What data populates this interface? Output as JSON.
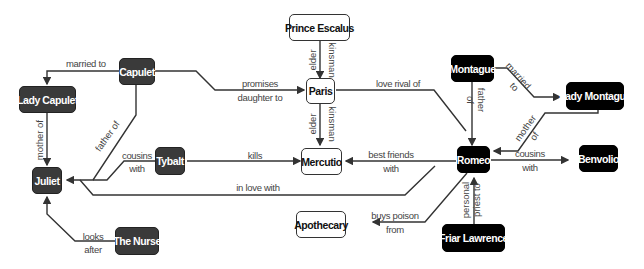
{
  "diagram": {
    "colors": {
      "capulet": "#3a3a3a",
      "montague": "#000000",
      "neutral": "#ffffff",
      "edge": "#333333"
    },
    "nodes": {
      "capulet": "Capulet",
      "lady_capulet": "Lady Capulet",
      "juliet": "Juliet",
      "tybalt": "Tybalt",
      "the_nurse": "The Nurse",
      "prince_escalus": "Prince Escalus",
      "paris": "Paris",
      "mercutio": "Mercutio",
      "apothecary": "Apothecary",
      "montague": "Montague",
      "lady_montague": "Lady Montague",
      "romeo": "Romeo",
      "benvolio": "Benvolio",
      "friar_lawrence": "Friar Lawrence"
    },
    "edges": {
      "capulet_lady": [
        "married to"
      ],
      "lady_juliet": [
        "mother of"
      ],
      "capulet_juliet": [
        "father of"
      ],
      "capulet_paris": [
        "promises",
        "daughter to"
      ],
      "tybalt_juliet": [
        "cousins",
        "with"
      ],
      "nurse_juliet": [
        "looks",
        "after"
      ],
      "tybalt_mercutio": [
        "kills"
      ],
      "romeo_juliet": [
        "in love with"
      ],
      "escalus_paris": [
        "elder",
        "kinsman"
      ],
      "escalus_mercutio": [
        "elder",
        "kinsman"
      ],
      "paris_romeo": [
        "love rival of"
      ],
      "romeo_mercutio": [
        "best friends",
        "with"
      ],
      "montague_lady": [
        "married",
        "to"
      ],
      "montague_romeo": [
        "father",
        "of"
      ],
      "ladym_romeo": [
        "mother",
        "of"
      ],
      "romeo_benvolio": [
        "cousins",
        "with"
      ],
      "romeo_apothecary": [
        "buys poison",
        "from"
      ],
      "friar_romeo": [
        "personal",
        "priest to"
      ]
    }
  }
}
